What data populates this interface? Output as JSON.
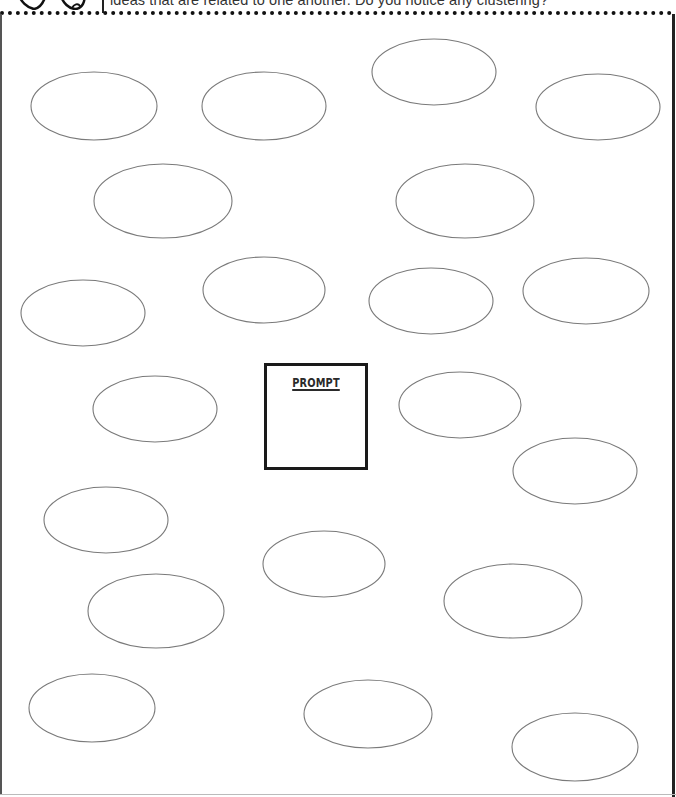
{
  "header": {
    "instruction_text": "ideas that are related to one another. Do you notice any clustering?",
    "icons": [
      "heart-hand-icon",
      "heart-hand-icon"
    ]
  },
  "prompt": {
    "label": "PROMPT",
    "value": ""
  },
  "bubbles": [
    {
      "id": 1,
      "cx": 94,
      "cy": 106,
      "rx": 63,
      "ry": 34,
      "value": ""
    },
    {
      "id": 2,
      "cx": 264,
      "cy": 106,
      "rx": 62,
      "ry": 34,
      "value": ""
    },
    {
      "id": 3,
      "cx": 434,
      "cy": 72,
      "rx": 62,
      "ry": 33,
      "value": ""
    },
    {
      "id": 4,
      "cx": 598,
      "cy": 107,
      "rx": 62,
      "ry": 33,
      "value": ""
    },
    {
      "id": 5,
      "cx": 163,
      "cy": 201,
      "rx": 69,
      "ry": 37,
      "value": ""
    },
    {
      "id": 6,
      "cx": 465,
      "cy": 201,
      "rx": 69,
      "ry": 37,
      "value": ""
    },
    {
      "id": 7,
      "cx": 264,
      "cy": 290,
      "rx": 61,
      "ry": 33,
      "value": ""
    },
    {
      "id": 8,
      "cx": 83,
      "cy": 313,
      "rx": 62,
      "ry": 33,
      "value": ""
    },
    {
      "id": 9,
      "cx": 431,
      "cy": 301,
      "rx": 62,
      "ry": 33,
      "value": ""
    },
    {
      "id": 10,
      "cx": 586,
      "cy": 291,
      "rx": 63,
      "ry": 33,
      "value": ""
    },
    {
      "id": 11,
      "cx": 155,
      "cy": 409,
      "rx": 62,
      "ry": 33,
      "value": ""
    },
    {
      "id": 12,
      "cx": 460,
      "cy": 405,
      "rx": 61,
      "ry": 33,
      "value": ""
    },
    {
      "id": 13,
      "cx": 575,
      "cy": 471,
      "rx": 62,
      "ry": 33,
      "value": ""
    },
    {
      "id": 14,
      "cx": 106,
      "cy": 520,
      "rx": 62,
      "ry": 33,
      "value": ""
    },
    {
      "id": 15,
      "cx": 324,
      "cy": 564,
      "rx": 61,
      "ry": 33,
      "value": ""
    },
    {
      "id": 16,
      "cx": 156,
      "cy": 611,
      "rx": 68,
      "ry": 37,
      "value": ""
    },
    {
      "id": 17,
      "cx": 513,
      "cy": 601,
      "rx": 69,
      "ry": 37,
      "value": ""
    },
    {
      "id": 18,
      "cx": 92,
      "cy": 708,
      "rx": 63,
      "ry": 34,
      "value": ""
    },
    {
      "id": 19,
      "cx": 368,
      "cy": 714,
      "rx": 64,
      "ry": 34,
      "value": ""
    },
    {
      "id": 20,
      "cx": 575,
      "cy": 747,
      "rx": 63,
      "ry": 34,
      "value": ""
    }
  ],
  "colors": {
    "bubble_stroke": "#7a7a7a",
    "frame": "#222222",
    "prompt_border": "#1a1a1a"
  }
}
